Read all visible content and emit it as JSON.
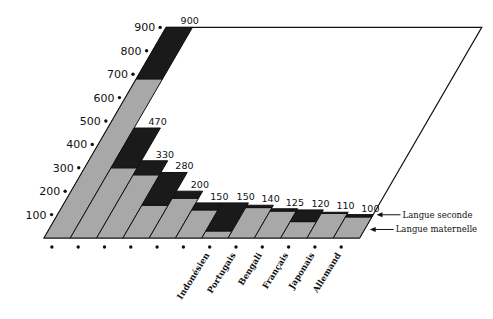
{
  "chart_data": {
    "type": "bar",
    "subtype": "stacked-3d-oblique",
    "title": "",
    "xlabel": "",
    "ylabel": "",
    "ylim": [
      0,
      900
    ],
    "yticks": [
      100,
      200,
      300,
      400,
      500,
      600,
      700,
      800,
      900
    ],
    "categories": [
      "",
      "",
      "",
      "",
      "",
      "",
      "Indonésien",
      "Portugais",
      "Bengali",
      "Français",
      "Japonais",
      "Allemand"
    ],
    "totals": [
      900,
      470,
      330,
      280,
      200,
      150,
      150,
      140,
      125,
      120,
      110,
      100
    ],
    "series": [
      {
        "name": "Langue maternelle",
        "color": "#a8a8a8",
        "values": [
          680,
          300,
          270,
          140,
          170,
          120,
          30,
          130,
          115,
          70,
          105,
          90
        ]
      },
      {
        "name": "Langue seconde",
        "color": "#1a1a1a",
        "values": [
          220,
          170,
          60,
          140,
          30,
          30,
          120,
          10,
          10,
          50,
          5,
          10
        ]
      }
    ],
    "legend": [
      "Langue seconde",
      "Langue maternelle"
    ],
    "legend_position": "right",
    "grid": false
  },
  "colors": {
    "native": "#a8a8a8",
    "second": "#1a1a1a",
    "outline": "#111111",
    "background": "#ffffff"
  }
}
